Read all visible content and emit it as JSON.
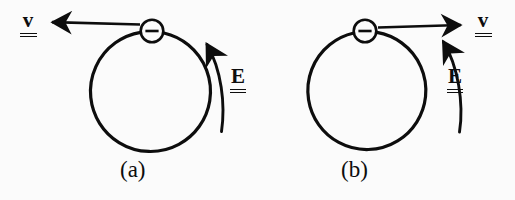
{
  "figure": {
    "background_color": "#fbfbfb",
    "ink_color": "#0d0d0d"
  },
  "panels": [
    {
      "id": "a",
      "caption": "(a)",
      "orbit": {
        "name": "circular-orbit",
        "center_x": 145,
        "center_y": 92,
        "radius": 60,
        "stroke_width": 3.2
      },
      "particle": {
        "name": "electron",
        "symbol": "−",
        "charge_sign": "minus",
        "center_x": 152,
        "center_y": 31,
        "radius": 11.5
      },
      "velocity": {
        "label": "v",
        "direction": "left",
        "arrow_from_x": 148,
        "arrow_from_y": 27,
        "arrow_to_x": 48,
        "arrow_to_y": 22,
        "label_x": 24,
        "label_y": 12
      },
      "field": {
        "label": "E",
        "direction": "counterclockwise-up",
        "arc_description": "curved arrow outside orbit on right side pointing up",
        "label_x": 232,
        "label_y": 68
      }
    },
    {
      "id": "b",
      "caption": "(b)",
      "orbit": {
        "name": "circular-orbit",
        "center_x": 359,
        "center_y": 92,
        "radius": 59,
        "stroke_width": 3.2
      },
      "particle": {
        "name": "electron",
        "symbol": "−",
        "charge_sign": "minus",
        "center_x": 365,
        "center_y": 31,
        "radius": 11.5
      },
      "velocity": {
        "label": "v",
        "direction": "right",
        "arrow_from_x": 381,
        "arrow_from_y": 27,
        "arrow_to_x": 466,
        "arrow_to_y": 23,
        "label_x": 480,
        "label_y": 12
      },
      "field": {
        "label": "E",
        "direction": "counterclockwise-up",
        "arc_description": "curved arrow outside orbit on right side pointing up",
        "label_x": 449,
        "label_y": 68
      }
    }
  ]
}
